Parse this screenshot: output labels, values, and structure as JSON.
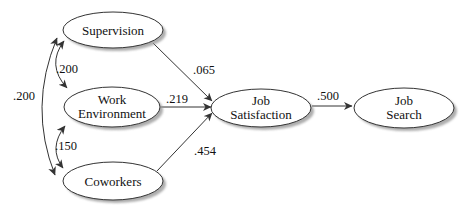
{
  "diagram": {
    "colors": {
      "background": "#ffffff",
      "stroke": "#333333",
      "node_fill": "#ffffff",
      "shadow": "#9a9a9a",
      "text": "#111111"
    },
    "nodes": {
      "supervision": {
        "label": "Supervision"
      },
      "work_environment": {
        "line1": "Work",
        "line2": "Environment"
      },
      "coworkers": {
        "label": "Coworkers"
      },
      "job_satisfaction": {
        "line1": "Job",
        "line2": "Satisfaction"
      },
      "job_search": {
        "line1": "Job",
        "line2": "Search"
      }
    },
    "path_coefficients": {
      "supervision_to_job_satisfaction": ".065",
      "work_environment_to_job_satisfaction": ".219",
      "coworkers_to_job_satisfaction": ".454",
      "job_satisfaction_to_job_search": ".500"
    },
    "correlations": {
      "supervision_with_work_environment": ".200",
      "work_environment_with_coworkers": ".150",
      "supervision_with_coworkers": ".200"
    }
  }
}
